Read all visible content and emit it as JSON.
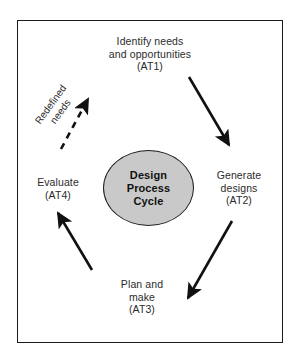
{
  "diagram": {
    "title": "Design Process Cycle",
    "frame": {
      "border_color": "#1a1a1a",
      "background": "#ffffff"
    },
    "center": {
      "name": "design-process-cycle",
      "fill_color": "#c9c9c9",
      "stroke_color": "#1c1c1c",
      "lines": [
        "Design",
        "Process",
        "Cycle"
      ]
    },
    "stages": [
      {
        "id": "at1",
        "position": "top",
        "lines": [
          "Identify needs",
          "and opportunities",
          "(AT1)"
        ],
        "code": "AT1"
      },
      {
        "id": "at2",
        "position": "right",
        "lines": [
          "Generate",
          "designs",
          "(AT2)"
        ],
        "code": "AT2"
      },
      {
        "id": "at3",
        "position": "bottom",
        "lines": [
          "Plan and",
          "make",
          "(AT3)"
        ],
        "code": "AT3"
      },
      {
        "id": "at4",
        "position": "left",
        "lines": [
          "Evaluate",
          "(AT4)"
        ],
        "code": "AT4"
      }
    ],
    "feedback": {
      "id": "redefined-needs",
      "lines": [
        "Redefined",
        "needs"
      ],
      "style": "dashed",
      "rotation_deg": -54
    },
    "arrows": [
      {
        "id": "at1-to-at2",
        "from": "at1",
        "to": "at2",
        "style": "solid",
        "color": "#111111"
      },
      {
        "id": "at2-to-at3",
        "from": "at2",
        "to": "at3",
        "style": "solid",
        "color": "#111111"
      },
      {
        "id": "at3-to-at4",
        "from": "at3",
        "to": "at4",
        "style": "solid",
        "color": "#111111"
      },
      {
        "id": "at4-to-at1",
        "from": "at4",
        "to": "at1",
        "style": "dashed",
        "color": "#111111"
      }
    ]
  }
}
